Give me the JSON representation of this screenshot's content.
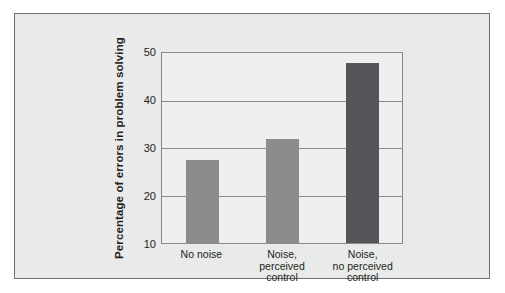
{
  "chart_data": {
    "type": "bar",
    "title": "",
    "xlabel": "",
    "ylabel": "Percentage of errors in problem solving",
    "categories": [
      "No noise",
      "Noise,\nperceived\ncontrol",
      "Noise,\nno perceived\ncontrol"
    ],
    "values": [
      27.5,
      32,
      48
    ],
    "ylim": [
      10,
      50
    ],
    "yticks": [
      10,
      20,
      30,
      40,
      50
    ],
    "ytick_labels": [
      "10",
      "20",
      "30",
      "40",
      "50"
    ],
    "grid": true,
    "legend": "none",
    "bar_colors": [
      "#8b8c8e",
      "#8b8c8e",
      "#55565a"
    ]
  },
  "figure": {
    "panel_background": "#e9eaea",
    "plot_background": "#eeefef",
    "border_color": "#6d6f71",
    "grid_color": "#86888a",
    "text_color": "#231f20",
    "page_background": "#ffffff"
  }
}
